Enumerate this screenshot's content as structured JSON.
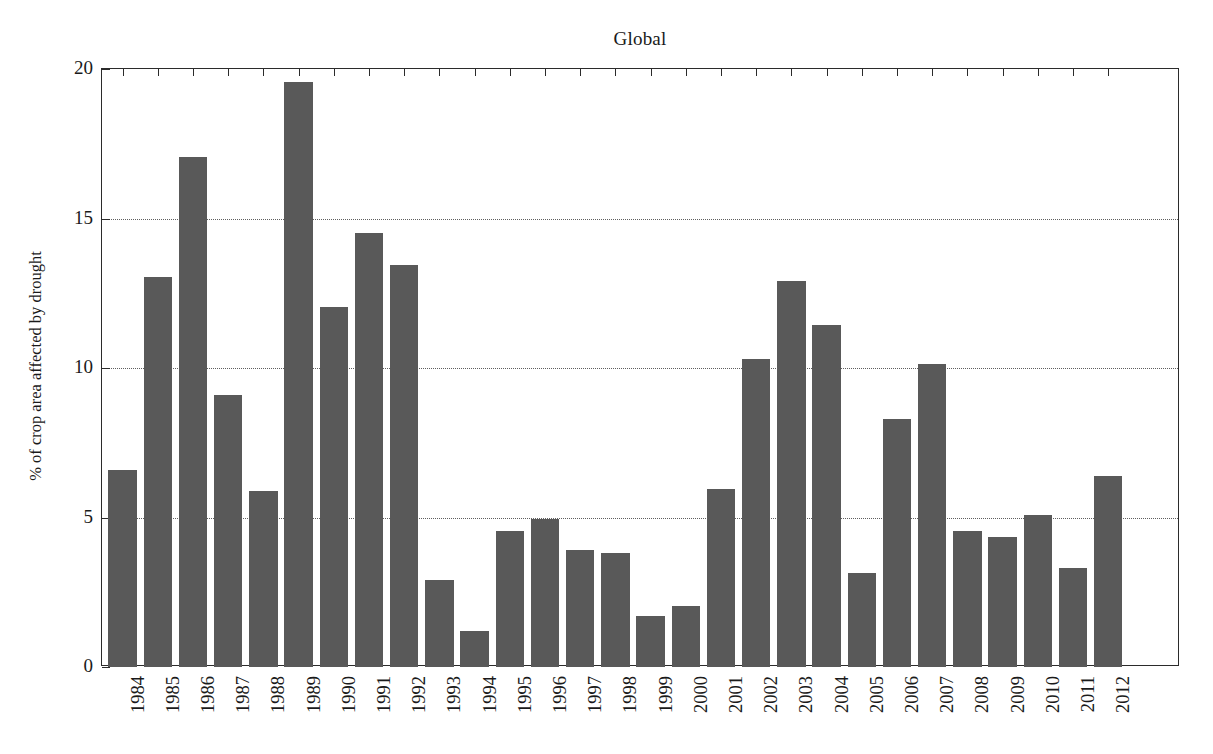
{
  "chart_data": {
    "type": "bar",
    "title": "Global",
    "xlabel": "",
    "ylabel": "% of crop area affected by drought",
    "categories": [
      "1984",
      "1985",
      "1986",
      "1987",
      "1988",
      "1989",
      "1990",
      "1991",
      "1992",
      "1993",
      "1994",
      "1995",
      "1996",
      "1997",
      "1998",
      "1999",
      "2000",
      "2001",
      "2002",
      "2003",
      "2004",
      "2005",
      "2006",
      "2007",
      "2008",
      "2009",
      "2010",
      "2011",
      "2012"
    ],
    "values": [
      6.6,
      13.05,
      17.05,
      9.1,
      5.9,
      19.55,
      12.05,
      14.5,
      13.45,
      2.9,
      1.2,
      4.55,
      4.95,
      3.9,
      3.8,
      1.7,
      2.05,
      5.95,
      10.3,
      12.9,
      11.45,
      3.15,
      8.3,
      10.15,
      4.55,
      4.35,
      5.1,
      3.3,
      6.4
    ],
    "ylim": [
      0,
      20
    ],
    "yticks": [
      0,
      5,
      10,
      15,
      20
    ],
    "ytick_labels": [
      "0",
      "5",
      "10",
      "15",
      "20"
    ],
    "gridlines": [
      5,
      10,
      15
    ],
    "grid": "horizontal-dotted",
    "legend": null,
    "bar_color": "#595959",
    "axis_color": "#2b2b2b",
    "grid_color": "#5f5f5f",
    "background": "#ffffff"
  }
}
